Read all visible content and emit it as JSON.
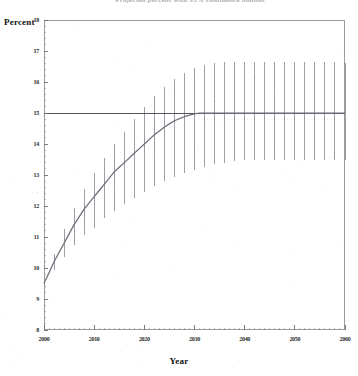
{
  "figure": {
    "title_partial": "Projected percent with 95% confidence bounds",
    "ylabel": "Percent",
    "xlabel": "Year"
  },
  "axes": {
    "y_ticks": [
      "8",
      "9",
      "10",
      "11",
      "12",
      "13",
      "14",
      "15",
      "16",
      "17",
      "18"
    ],
    "x_ticks": [
      "2000",
      "2010",
      "2020",
      "2030",
      "2040",
      "2050",
      "2060"
    ]
  },
  "colors": {
    "frame": "#9a9a9a",
    "curve": "#6d6d78",
    "errorbar": "#8c8c95",
    "reference_line": "#55555f",
    "text": "#1a1a1a"
  },
  "chart_data": {
    "type": "line",
    "title": "Projected percent with 95% confidence bounds",
    "xlabel": "Year",
    "ylabel": "Percent",
    "xlim": [
      2000,
      2060
    ],
    "ylim": [
      8,
      18
    ],
    "grid": false,
    "legend": "none",
    "reference_line": {
      "y": 15,
      "orientation": "horizontal",
      "label": ""
    },
    "x": [
      2000,
      2001,
      2002,
      2003,
      2004,
      2005,
      2006,
      2007,
      2008,
      2009,
      2010,
      2011,
      2012,
      2013,
      2014,
      2015,
      2016,
      2017,
      2018,
      2019,
      2020,
      2021,
      2022,
      2023,
      2024,
      2025,
      2026,
      2027,
      2028,
      2029,
      2030,
      2031,
      2032,
      2033,
      2034,
      2035,
      2036,
      2037,
      2038,
      2039,
      2040,
      2041,
      2042,
      2043,
      2044,
      2045,
      2046,
      2047,
      2048,
      2049,
      2050,
      2051,
      2052,
      2053,
      2054,
      2055,
      2056,
      2057,
      2058,
      2059,
      2060
    ],
    "series": [
      {
        "name": "Projected percent",
        "values": [
          9.5,
          9.85,
          10.2,
          10.5,
          10.8,
          11.1,
          11.4,
          11.65,
          11.9,
          12.1,
          12.3,
          12.5,
          12.7,
          12.9,
          13.1,
          13.25,
          13.4,
          13.55,
          13.7,
          13.85,
          14.0,
          14.15,
          14.3,
          14.42,
          14.55,
          14.65,
          14.75,
          14.82,
          14.88,
          14.93,
          14.97,
          15.0,
          15.0,
          15.0,
          15.0,
          15.0,
          15.0,
          15.0,
          15.0,
          15.0,
          15.0,
          15.0,
          15.0,
          15.0,
          15.0,
          15.0,
          15.0,
          15.0,
          15.0,
          15.0,
          15.0,
          15.0,
          15.0,
          15.0,
          15.0,
          15.0,
          15.0,
          15.0,
          15.0,
          15.0,
          15.0
        ]
      },
      {
        "name": "Lower 95% bound",
        "values": [
          9.5,
          9.7,
          9.95,
          10.15,
          10.35,
          10.55,
          10.75,
          10.9,
          11.05,
          11.2,
          11.3,
          11.45,
          11.6,
          11.7,
          11.85,
          11.95,
          12.05,
          12.15,
          12.25,
          12.35,
          12.45,
          12.55,
          12.65,
          12.72,
          12.8,
          12.88,
          12.95,
          13.0,
          13.05,
          13.1,
          13.15,
          13.2,
          13.25,
          13.3,
          13.35,
          13.38,
          13.4,
          13.42,
          13.45,
          13.47,
          13.5,
          13.5,
          13.5,
          13.5,
          13.5,
          13.5,
          13.5,
          13.5,
          13.5,
          13.5,
          13.5,
          13.5,
          13.5,
          13.5,
          13.5,
          13.5,
          13.5,
          13.5,
          13.5,
          13.5,
          13.5
        ]
      },
      {
        "name": "Upper 95% bound",
        "values": [
          9.5,
          10.0,
          10.45,
          10.85,
          11.25,
          11.6,
          11.95,
          12.25,
          12.55,
          12.8,
          13.05,
          13.3,
          13.55,
          13.8,
          14.0,
          14.2,
          14.4,
          14.6,
          14.8,
          15.0,
          15.2,
          15.4,
          15.55,
          15.7,
          15.85,
          16.0,
          16.1,
          16.2,
          16.3,
          16.38,
          16.45,
          16.5,
          16.55,
          16.58,
          16.6,
          16.62,
          16.63,
          16.64,
          16.65,
          16.65,
          16.65,
          16.65,
          16.65,
          16.65,
          16.65,
          16.65,
          16.65,
          16.65,
          16.65,
          16.65,
          16.65,
          16.65,
          16.65,
          16.65,
          16.65,
          16.65,
          16.65,
          16.65,
          16.65,
          16.62,
          16.6
        ]
      }
    ]
  }
}
